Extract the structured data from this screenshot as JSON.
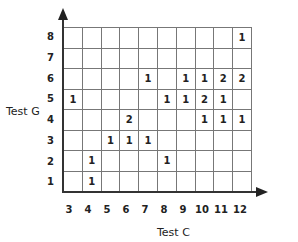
{
  "chart_data": {
    "type": "table",
    "title": "",
    "xlabel": "Test C",
    "ylabel": "Test G",
    "x_ticks": [
      3,
      4,
      5,
      6,
      7,
      8,
      9,
      10,
      11,
      12
    ],
    "y_ticks": [
      8,
      7,
      6,
      5,
      4,
      3,
      2,
      1
    ],
    "grid": true,
    "cells": [
      {
        "x": 12,
        "y": 8,
        "count": 1
      },
      {
        "x": 7,
        "y": 6,
        "count": 1
      },
      {
        "x": 9,
        "y": 6,
        "count": 1
      },
      {
        "x": 10,
        "y": 6,
        "count": 1
      },
      {
        "x": 11,
        "y": 6,
        "count": 2
      },
      {
        "x": 12,
        "y": 6,
        "count": 2
      },
      {
        "x": 3,
        "y": 5,
        "count": 1
      },
      {
        "x": 8,
        "y": 5,
        "count": 1
      },
      {
        "x": 9,
        "y": 5,
        "count": 1
      },
      {
        "x": 10,
        "y": 5,
        "count": 2
      },
      {
        "x": 11,
        "y": 5,
        "count": 1
      },
      {
        "x": 6,
        "y": 4,
        "count": 2
      },
      {
        "x": 10,
        "y": 4,
        "count": 1
      },
      {
        "x": 11,
        "y": 4,
        "count": 1
      },
      {
        "x": 12,
        "y": 4,
        "count": 1
      },
      {
        "x": 5,
        "y": 3,
        "count": 1
      },
      {
        "x": 6,
        "y": 3,
        "count": 1
      },
      {
        "x": 7,
        "y": 3,
        "count": 1
      },
      {
        "x": 4,
        "y": 2,
        "count": 1
      },
      {
        "x": 8,
        "y": 2,
        "count": 1
      },
      {
        "x": 4,
        "y": 1,
        "count": 1
      }
    ],
    "rows": [
      [
        "",
        "",
        "",
        "",
        "",
        "",
        "",
        "",
        "",
        "1"
      ],
      [
        "",
        "",
        "",
        "",
        "",
        "",
        "",
        "",
        "",
        ""
      ],
      [
        "",
        "",
        "",
        "",
        "1",
        "",
        "1",
        "1",
        "2",
        "2"
      ],
      [
        "1",
        "",
        "",
        "",
        "",
        "1",
        "1",
        "2",
        "1",
        ""
      ],
      [
        "",
        "",
        "",
        "2",
        "",
        "",
        "",
        "1",
        "1",
        "1"
      ],
      [
        "",
        "",
        "1",
        "1",
        "1",
        "",
        "",
        "",
        "",
        ""
      ],
      [
        "",
        "1",
        "",
        "",
        "",
        "1",
        "",
        "",
        "",
        ""
      ],
      [
        "",
        "1",
        "",
        "",
        "",
        "",
        "",
        "",
        "",
        ""
      ]
    ]
  }
}
